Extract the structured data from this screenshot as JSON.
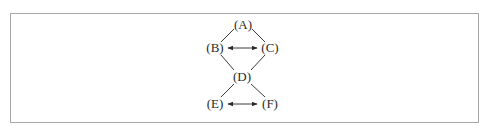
{
  "diagram": {
    "type": "lattice",
    "border_color": "#a8a8a8",
    "ink_color": "#2a2a2a",
    "nodes": [
      {
        "id": "A",
        "label": "(A)",
        "x": 243,
        "y": 25
      },
      {
        "id": "B",
        "label": "(B)",
        "x": 215,
        "y": 48
      },
      {
        "id": "C",
        "label": "(C)",
        "x": 270,
        "y": 48
      },
      {
        "id": "D",
        "label": "(D)",
        "x": 242,
        "y": 77
      },
      {
        "id": "E",
        "label": "(E)",
        "x": 215,
        "y": 104
      },
      {
        "id": "F",
        "label": "(F)",
        "x": 270,
        "y": 104
      }
    ],
    "edges": [
      {
        "from": "A",
        "to": "B",
        "style": "line"
      },
      {
        "from": "A",
        "to": "C",
        "style": "line"
      },
      {
        "from": "B",
        "to": "C",
        "style": "double-arrow"
      },
      {
        "from": "B",
        "to": "D",
        "style": "line"
      },
      {
        "from": "C",
        "to": "D",
        "style": "line"
      },
      {
        "from": "D",
        "to": "E",
        "style": "line"
      },
      {
        "from": "D",
        "to": "F",
        "style": "line"
      },
      {
        "from": "E",
        "to": "F",
        "style": "double-arrow"
      }
    ]
  }
}
